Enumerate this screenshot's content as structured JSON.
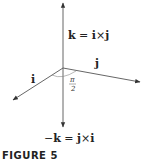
{
  "figure": {
    "caption": "FIGURE 5",
    "labels": {
      "top": {
        "lhs": "k",
        "eq": " = ",
        "a": "i",
        "op": "×",
        "b": "j"
      },
      "bottom": {
        "neg": "−",
        "lhs": "k",
        "eq": " = ",
        "a": "j",
        "op": "×",
        "b": "i"
      },
      "i": "i",
      "j": "j",
      "angle_num": "π",
      "angle_den": "2"
    },
    "colors": {
      "line": "#444444",
      "text": "#222222"
    }
  }
}
